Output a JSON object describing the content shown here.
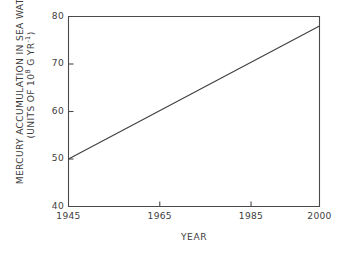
{
  "chart_data": {
    "type": "line",
    "title": "",
    "xlabel": "YEAR",
    "ylabel_line1": "MERCURY ACCUMULATION IN SEA WATER",
    "ylabel_line2_prefix": "(UNITS OF 10",
    "ylabel_line2_sup": "8",
    "ylabel_line2_suffix": " G YR",
    "ylabel_line2_sup2": "-1",
    "ylabel_line2_end": ")",
    "xlim": [
      1945,
      2000
    ],
    "ylim": [
      40,
      80
    ],
    "grid": false,
    "legend": false,
    "x": [
      1945,
      2000
    ],
    "y": [
      50,
      78
    ],
    "series": [
      {
        "name": "mercury accumulation",
        "x": [
          1945,
          2000
        ],
        "values": [
          50,
          78
        ],
        "color": "#404040"
      }
    ],
    "xticks": [
      {
        "value": 1945,
        "label": "1945",
        "major": true
      },
      {
        "value": 1965,
        "label": "1965",
        "major": true
      },
      {
        "value": 1985,
        "label": "1985",
        "major": true
      },
      {
        "value": 2000,
        "label": "2000",
        "major": true
      }
    ],
    "yticks": [
      {
        "value": 40,
        "label": "40"
      },
      {
        "value": 50,
        "label": "50"
      },
      {
        "value": 60,
        "label": "60"
      },
      {
        "value": 70,
        "label": "70"
      },
      {
        "value": 80,
        "label": "80"
      }
    ]
  },
  "style": {
    "background": "#ffffff",
    "axis_color": "#4a4a4a",
    "line_color": "#404040",
    "text_color": "#3d3d3d"
  }
}
